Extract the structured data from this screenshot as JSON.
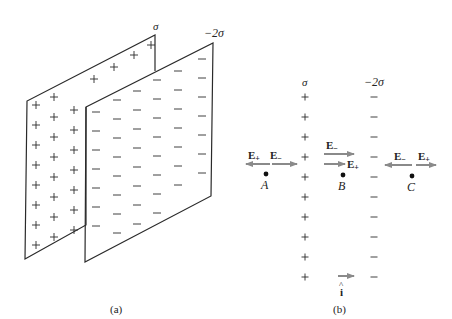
{
  "colors": {
    "ink": "#2a2a2a",
    "arrow": "#8a8a8a",
    "background": "#ffffff"
  },
  "panel_a": {
    "caption": "(a)",
    "front_plane": {
      "label": "σ",
      "sign": "+"
    },
    "back_plane": {
      "label": "−2σ",
      "sign": "−"
    }
  },
  "panel_b": {
    "caption": "(b)",
    "left_sheet": {
      "label": "σ",
      "sign": "+"
    },
    "right_sheet": {
      "label": "−2σ",
      "sign": "−"
    },
    "points": [
      {
        "name": "A",
        "fields": [
          "E+ (left)",
          "E− (right)"
        ]
      },
      {
        "name": "B",
        "fields": [
          "E− (right)",
          "E+ (right)"
        ]
      },
      {
        "name": "C",
        "fields": [
          "E− (left)",
          "E+ (right)"
        ]
      }
    ],
    "field_labels": {
      "e_plus": "E",
      "e_plus_sub": "+",
      "e_minus": "E",
      "e_minus_sub": "−"
    },
    "unit_vector": {
      "symbol": "i",
      "hat": "^"
    }
  }
}
